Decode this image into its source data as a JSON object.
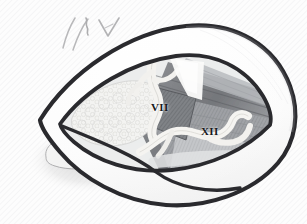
{
  "figure": {
    "background_color": "#fcfcfc",
    "outline_color": "#2a2a2e",
    "muscle_dark": "#6f7175",
    "muscle_mid": "#9a9ca0",
    "muscle_light": "#c2c4c7",
    "nerve_color": "#f2f1ee",
    "gland_color": "#f0f0ee",
    "shadow_color": "#dcdcdc",
    "sketch_color": "#b7b7b9"
  },
  "labels": [
    {
      "id": "vii",
      "text": "VII",
      "x": 151,
      "y": 102,
      "meaning": "facial-nerve"
    },
    {
      "id": "xii",
      "text": "XII",
      "x": 201,
      "y": 126,
      "meaning": "hypoglossal-nerve"
    }
  ],
  "annotations": {
    "sketch_marks": "two parallel pencil strokes, a small squiggle, and a V-shaped arrow at upper left",
    "inset_outline": "faint tongue-shaped outline with soft shadow at lower left"
  }
}
